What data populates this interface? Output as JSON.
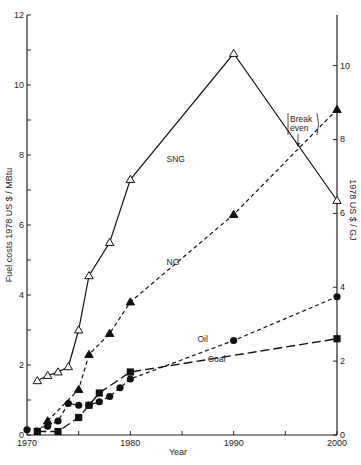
{
  "chart_data": {
    "type": "line",
    "title": "",
    "xlabel": "Year",
    "ylabel": "Fuel costs   1978 US $ / MBtu",
    "ylabel_right": "1978 US $ / GJ",
    "xlim": [
      1970,
      2000
    ],
    "ylim": [
      0,
      12
    ],
    "ylim_right": [
      0,
      11.37
    ],
    "x_ticks": [
      1970,
      1975,
      1980,
      1985,
      1990,
      1995,
      2000
    ],
    "x_tick_labels": [
      "1970",
      "",
      "1980",
      "",
      "1990",
      "",
      "2000"
    ],
    "y_ticks": [
      0,
      1,
      2,
      3,
      4,
      5,
      6,
      7,
      8,
      9,
      10,
      11,
      12
    ],
    "y_tick_labels": [
      "0",
      "",
      "2",
      "",
      "4",
      "",
      "6",
      "",
      "8",
      "",
      "10",
      "",
      "12"
    ],
    "y_right_ticks": [
      0,
      2,
      4,
      6,
      8,
      10
    ],
    "y_right_tick_labels": [
      "0",
      "2",
      "4",
      "6",
      "8",
      "10"
    ],
    "grid": false,
    "legend": "inline labels",
    "annotations": [
      {
        "text": "Break even",
        "x": 1996.5,
        "y": 7.6
      }
    ],
    "series": [
      {
        "name": "SNG",
        "marker": "open-triangle",
        "line": "solid",
        "x": [
          1971,
          1972,
          1973,
          1974,
          1975,
          1976,
          1978,
          1980,
          1990,
          2000
        ],
        "values": [
          1.55,
          1.7,
          1.8,
          1.95,
          3.0,
          4.55,
          5.5,
          7.3,
          10.9,
          6.7
        ]
      },
      {
        "name": "NG",
        "marker": "filled-triangle",
        "line": "short-dash",
        "x": [
          1972,
          1975,
          1976,
          1978,
          1980,
          1990,
          2000
        ],
        "values": [
          0.4,
          1.3,
          2.3,
          2.9,
          3.8,
          6.3,
          9.3
        ]
      },
      {
        "name": "Oil",
        "marker": "filled-circle",
        "line": "short-dash",
        "x": [
          1970,
          1972,
          1973,
          1974,
          1975,
          1976,
          1977,
          1978,
          1979,
          1980,
          1990,
          2000
        ],
        "values": [
          0.15,
          0.25,
          0.4,
          0.9,
          0.85,
          0.85,
          0.95,
          1.1,
          1.35,
          1.6,
          2.7,
          3.95
        ]
      },
      {
        "name": "Coal",
        "marker": "filled-square",
        "line": "long-dash",
        "x": [
          1971,
          1973,
          1975,
          1976,
          1977,
          1980,
          2000
        ],
        "values": [
          0.1,
          0.1,
          0.5,
          0.85,
          1.2,
          1.8,
          2.75
        ]
      }
    ],
    "series_labels": [
      {
        "name": "SNG",
        "x": 1983.5,
        "y": 7.8
      },
      {
        "name": "NG",
        "x": 1983.5,
        "y": 4.85
      },
      {
        "name": "Oil",
        "x": 1986.5,
        "y": 2.65
      },
      {
        "name": "Coal",
        "x": 1987.5,
        "y": 2.1
      }
    ]
  },
  "labels": {
    "x_axis_title": "Year",
    "y_axis_title": "Fuel costs   1978 US $ / MBtu",
    "y_axis_right_title": "1978 US $ / GJ",
    "break_even_line1": "Break",
    "break_even_line2": "even"
  }
}
